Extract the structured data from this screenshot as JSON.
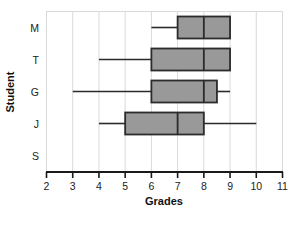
{
  "chart_data": {
    "type": "box",
    "title": "",
    "xlabel": "Grades",
    "ylabel": "Student",
    "xlim": [
      2,
      11
    ],
    "xticks": [
      2,
      3,
      4,
      5,
      6,
      7,
      8,
      9,
      10,
      11
    ],
    "xtick_labels": [
      "2",
      "3",
      "4",
      "5",
      "6",
      "7",
      "8",
      "9",
      "10",
      "11"
    ],
    "categories": [
      "M",
      "T",
      "G",
      "J",
      "S"
    ],
    "grid": true,
    "grid_axis": "x",
    "legend": "none",
    "orientation": "horizontal",
    "box_fill": "#999999",
    "box_stroke": "#2b2b2b",
    "boxes": [
      {
        "category": "M",
        "whisker_low": 6,
        "q1": 7,
        "median": 8,
        "q3": 9,
        "whisker_high": 9,
        "has_low_whisker": true,
        "has_high_whisker": false
      },
      {
        "category": "T",
        "whisker_low": 4,
        "q1": 6,
        "median": 8,
        "q3": 9,
        "whisker_high": 9,
        "has_low_whisker": true,
        "has_high_whisker": false
      },
      {
        "category": "G",
        "whisker_low": 3,
        "q1": 6,
        "median": 8,
        "q3": 8.5,
        "whisker_high": 9,
        "has_low_whisker": true,
        "has_high_whisker": true
      },
      {
        "category": "J",
        "whisker_low": 4,
        "q1": 5,
        "median": 7,
        "q3": 8,
        "whisker_high": 10,
        "has_low_whisker": true,
        "has_high_whisker": true
      },
      {
        "category": "S",
        "whisker_low": null,
        "q1": null,
        "median": null,
        "q3": null,
        "whisker_high": null,
        "has_low_whisker": false,
        "has_high_whisker": false
      }
    ]
  },
  "axes": {
    "x_title": "Grades",
    "y_title": "Student",
    "x_tick_labels": [
      "2",
      "3",
      "4",
      "5",
      "6",
      "7",
      "8",
      "9",
      "10",
      "11"
    ],
    "y_tick_labels": [
      "M",
      "T",
      "G",
      "J",
      "S"
    ]
  }
}
